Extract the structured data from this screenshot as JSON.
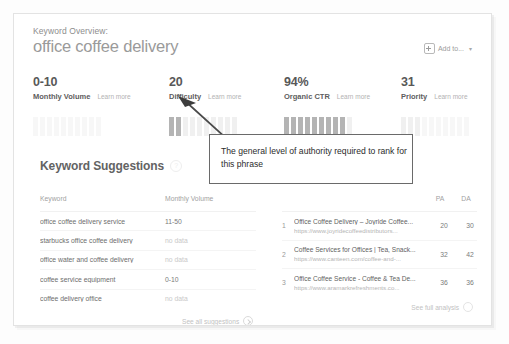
{
  "header": {
    "eyebrow": "Keyword Overview:",
    "title": "office coffee delivery",
    "add_to_label": "Add to...",
    "add_to_icon": "plus-square-icon",
    "add_to_chevron": "▾"
  },
  "metrics": [
    {
      "value": "0-10",
      "name": "Monthly Volume",
      "learn_more": "Learn more",
      "filled_bars": 0,
      "total_bars": 10,
      "style": "faint"
    },
    {
      "value": "20",
      "name": "Difficulty",
      "learn_more": "Learn more",
      "filled_bars": 2,
      "total_bars": 10,
      "style": "normal"
    },
    {
      "value": "94%",
      "name": "Organic CTR",
      "learn_more": "Learn more",
      "filled_bars": 9,
      "total_bars": 10,
      "style": "normal"
    },
    {
      "value": "31",
      "name": "Priority",
      "learn_more": "Learn more",
      "filled_bars": 3,
      "total_bars": 10,
      "style": "faint"
    }
  ],
  "suggestions": {
    "heading": "Keyword Suggestions",
    "help_icon": "question-circle-icon",
    "help_glyph": "?",
    "columns": [
      "Keyword",
      "Monthly Volume"
    ],
    "rows": [
      {
        "keyword": "office coffee delivery service",
        "volume": "11-50",
        "no_data": false
      },
      {
        "keyword": "starbucks office coffee delivery",
        "volume": "no data",
        "no_data": true
      },
      {
        "keyword": "office water and coffee delivery",
        "volume": "no data",
        "no_data": true
      },
      {
        "keyword": "coffee service equipment",
        "volume": "0-10",
        "no_data": false
      },
      {
        "keyword": "coffee delivery office",
        "volume": "no data",
        "no_data": true
      }
    ],
    "see_all_label": "See all suggestions",
    "see_all_icon": "arrow-circle-right-icon"
  },
  "serp": {
    "columns": [
      "PA",
      "DA"
    ],
    "rows": [
      {
        "index": "1",
        "title": "Office Coffee Delivery – Joyride Coffee...",
        "url": "https://www.joyridecoffeedistributors...",
        "pa": "20",
        "da": "30"
      },
      {
        "index": "2",
        "title": "Coffee Services for Offices | Tea, Snack...",
        "url": "https://www.canteen.com/coffee-and-...",
        "pa": "32",
        "da": "42"
      },
      {
        "index": "3",
        "title": "Office Coffee Service - Coffee & Tea De...",
        "url": "https://www.aramarkrefreshments.co...",
        "pa": "36",
        "da": "36"
      }
    ],
    "see_full_label": "See full analysis",
    "see_full_icon": "arrow-circle-right-icon"
  },
  "annotation": {
    "text": "The general level of authority required to rank for this phrase",
    "points_at": "Difficulty",
    "arrow_icon": "annotation-arrow-icon"
  },
  "colors": {
    "bar_filled": "#b4b4b4",
    "bar_empty": "#f0f0f0",
    "text_primary": "#585858",
    "text_muted": "#b2b2b2",
    "annotation_border": "#6a6a6a"
  }
}
